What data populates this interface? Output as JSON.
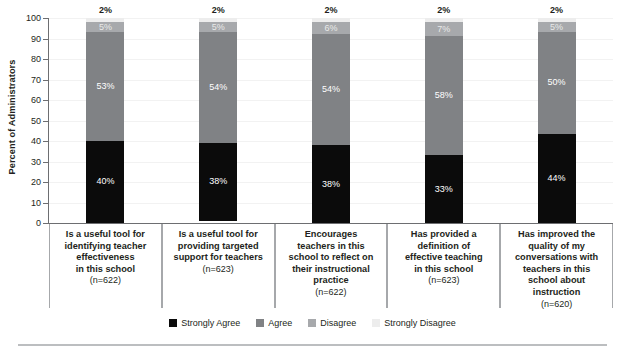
{
  "chart_data": {
    "type": "bar",
    "subtype": "stacked-column-100",
    "title": "",
    "xlabel": "",
    "ylabel": "Percent of Administrators",
    "ylim": [
      0,
      100
    ],
    "yticks": [
      0,
      10,
      20,
      30,
      40,
      50,
      60,
      70,
      80,
      90,
      100
    ],
    "ytick_labels": [
      "0",
      "10",
      "20",
      "30",
      "40",
      "50",
      "60",
      "70",
      "80",
      "90",
      "100"
    ],
    "grid": true,
    "legend_position": "bottom-center",
    "categories": [
      "Is a useful tool for identifying teacher effectiveness in this school",
      "Is a useful tool for providing targeted support for teachers",
      "Encourages teachers in this school to reflect on their instructional practice",
      "Has provided a definition of effective teaching in this school",
      "Has improved the quality of my conversations with teachers in this school about instruction"
    ],
    "category_lines": [
      [
        "Is a useful tool for",
        "identifying teacher",
        "effectiveness",
        "in this school"
      ],
      [
        "Is a useful tool for",
        "providing targeted",
        "support for teachers"
      ],
      [
        "Encourages",
        "teachers in this",
        "school to reflect on",
        "their instructional",
        "practice"
      ],
      [
        "Has provided a",
        "definition of",
        "effective teaching",
        "in this school"
      ],
      [
        "Has improved the",
        "quality of my",
        "conversations with",
        "teachers in this",
        "school about",
        "instruction"
      ]
    ],
    "category_n": [
      "(n=622)",
      "(n=623)",
      "(n=622)",
      "(n=623)",
      "(n=620)"
    ],
    "series": [
      {
        "name": "Strongly Agree",
        "color": "#0b0b0b",
        "values": [
          40,
          38,
          38,
          33,
          44
        ],
        "labels": [
          "40%",
          "38%",
          "38%",
          "33%",
          "44%"
        ]
      },
      {
        "name": "Agree",
        "color": "#808285",
        "values": [
          53,
          54,
          54,
          58,
          50
        ],
        "labels": [
          "53%",
          "54%",
          "54%",
          "58%",
          "50%"
        ]
      },
      {
        "name": "Disagree",
        "color": "#a7a9ac",
        "values": [
          5,
          5,
          6,
          7,
          5
        ],
        "labels": [
          "5%",
          "5%",
          "6%",
          "7%",
          "5%"
        ]
      },
      {
        "name": "Strongly Disagree",
        "color": "#ededed",
        "values": [
          2,
          2,
          2,
          2,
          2
        ],
        "labels": [
          "2%",
          "2%",
          "2%",
          "2%",
          "2%"
        ]
      }
    ],
    "legend": [
      {
        "label": "Strongly Agree",
        "color": "#0b0b0b"
      },
      {
        "label": "Agree",
        "color": "#808285"
      },
      {
        "label": "Disagree",
        "color": "#a7a9ac"
      },
      {
        "label": "Strongly Disagree",
        "color": "#ededed"
      }
    ]
  }
}
